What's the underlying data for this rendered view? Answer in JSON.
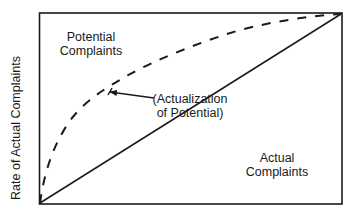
{
  "diagram": {
    "y_axis_label": "Rate of Actual Complaints",
    "regions": {
      "potential": {
        "line1": "Potential",
        "line2": "Complaints"
      },
      "actual": {
        "line1": "Actual",
        "line2": "Complaints"
      }
    },
    "annotation": {
      "line1": "(Actualization",
      "line2": "of Potential)"
    },
    "curves": [
      {
        "name": "Potential Complaints",
        "style": "dashed",
        "shape": "concave"
      },
      {
        "name": "Actual Complaints",
        "style": "solid",
        "shape": "linear"
      }
    ],
    "colors": {
      "ink": "#1a1a1a",
      "background": "#ffffff"
    }
  }
}
